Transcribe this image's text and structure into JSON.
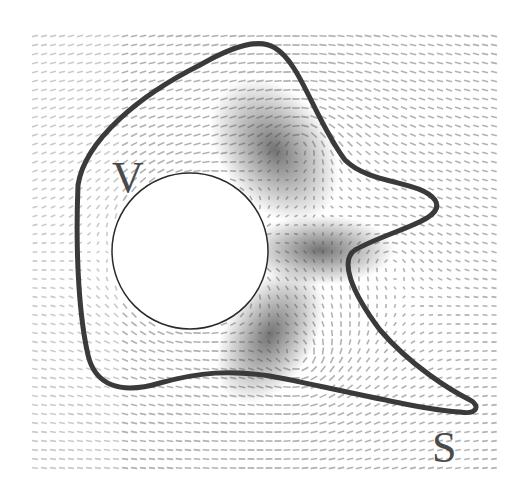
{
  "figure": {
    "labels": {
      "volume": "V",
      "surface": "S"
    },
    "colors": {
      "background": "#ffffff",
      "field_light": "#bdbdbd",
      "field_dark": "#555555",
      "contour": "#3a3a3a",
      "obstacle_fill": "#ffffff",
      "obstacle_edge": "#2a2a2a"
    },
    "elements": {
      "obstacle": "circular-cylinder",
      "contour": "closed-curve-S",
      "region": "control-volume-V",
      "field": "vector-field-arrows"
    }
  }
}
